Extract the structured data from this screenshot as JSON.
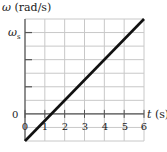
{
  "chart_data": {
    "type": "line",
    "title": "",
    "xlabel": "t (s)",
    "ylabel": "ω (rad/s)",
    "x_ticks": [
      "0",
      "1",
      "2",
      "3",
      "4",
      "5",
      "6"
    ],
    "y_ticks": [
      "0",
      "ωs"
    ],
    "xlim": [
      0,
      6
    ],
    "ylim_in_grid_units": [
      -2,
      7
    ],
    "ylim_in_omega_s": [
      -0.333,
      1.167
    ],
    "grid": true,
    "legend": "none",
    "series": [
      {
        "name": "ω(t)",
        "x": [
          0,
          6
        ],
        "y_grid_units": [
          -2,
          7
        ],
        "y_omega_s": [
          -0.333,
          1.167
        ],
        "zero_crossing_t": 1.33
      }
    ],
    "annotations": [
      "ωs marked on y-axis at 6 grid units above 0"
    ]
  },
  "labels": {
    "y_axis_symbol": "ω",
    "y_axis_unit": " (rad/s)",
    "x_axis_symbol": "t",
    "x_axis_unit": " (s)",
    "y_tick_zero": "0",
    "y_tick_ws_symbol": "ω",
    "y_tick_ws_sub": "s",
    "x_tick_0": "0",
    "x_tick_1": "1",
    "x_tick_2": "2",
    "x_tick_3": "3",
    "x_tick_4": "4",
    "x_tick_5": "5",
    "x_tick_6": "6"
  },
  "colors": {
    "grid": "#c8c8c8",
    "axis": "#555555",
    "line": "#111111",
    "text": "#222222"
  }
}
